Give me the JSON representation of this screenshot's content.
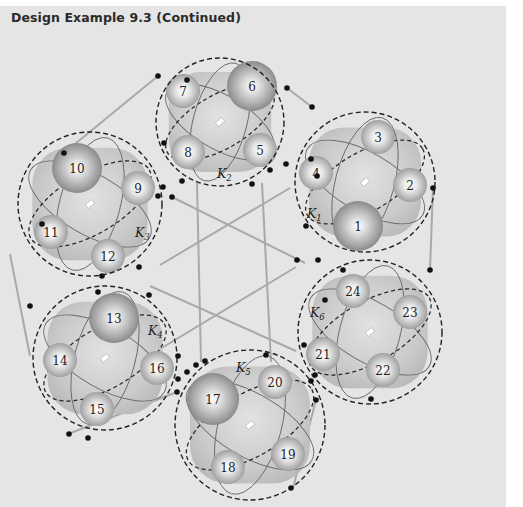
{
  "header": {
    "title": "Design Example 9.3  (Continued)"
  },
  "diagram": {
    "colors": {
      "panel_bg": "#e5e5e5",
      "line": "#a9a9a9",
      "dashed": "#222222",
      "node": "#111111",
      "cluster_fill": "#c8c8c8",
      "sphere_light": "#ffffff",
      "sphere_dark": "#8a8a8a"
    },
    "clusters": [
      {
        "id": "K1",
        "label": "K",
        "sub": "1",
        "cx": 365,
        "cy": 182,
        "r": 70,
        "label_x": 307,
        "label_y": 218,
        "spheres": [
          {
            "n": "1",
            "x": 358,
            "y": 226,
            "r": 25
          },
          {
            "n": "2",
            "x": 410,
            "y": 185,
            "r": 17
          },
          {
            "n": "3",
            "x": 378,
            "y": 137,
            "r": 17
          },
          {
            "n": "4",
            "x": 316,
            "y": 173,
            "r": 17
          }
        ]
      },
      {
        "id": "K2",
        "label": "K",
        "sub": "2",
        "cx": 220,
        "cy": 122,
        "r": 64,
        "label_x": 217,
        "label_y": 178,
        "spheres": [
          {
            "n": "5",
            "x": 260,
            "y": 150,
            "r": 17
          },
          {
            "n": "6",
            "x": 252,
            "y": 86,
            "r": 25
          },
          {
            "n": "7",
            "x": 183,
            "y": 91,
            "r": 17
          },
          {
            "n": "8",
            "x": 188,
            "y": 152,
            "r": 17
          }
        ]
      },
      {
        "id": "K3",
        "label": "K",
        "sub": "3",
        "cx": 90,
        "cy": 204,
        "r": 72,
        "label_x": 135,
        "label_y": 237,
        "spheres": [
          {
            "n": "9",
            "x": 138,
            "y": 188,
            "r": 17
          },
          {
            "n": "10",
            "x": 77,
            "y": 168,
            "r": 25
          },
          {
            "n": "11",
            "x": 51,
            "y": 232,
            "r": 17
          },
          {
            "n": "12",
            "x": 108,
            "y": 256,
            "r": 17
          }
        ]
      },
      {
        "id": "K4",
        "label": "K",
        "sub": "4",
        "cx": 105,
        "cy": 358,
        "r": 72,
        "label_x": 148,
        "label_y": 335,
        "spheres": [
          {
            "n": "13",
            "x": 114,
            "y": 318,
            "r": 25
          },
          {
            "n": "14",
            "x": 60,
            "y": 360,
            "r": 17
          },
          {
            "n": "15",
            "x": 97,
            "y": 409,
            "r": 17
          },
          {
            "n": "16",
            "x": 157,
            "y": 368,
            "r": 17
          }
        ]
      },
      {
        "id": "K5",
        "label": "K",
        "sub": "5",
        "cx": 250,
        "cy": 425,
        "r": 75,
        "label_x": 236,
        "label_y": 372,
        "spheres": [
          {
            "n": "17",
            "x": 213,
            "y": 399,
            "r": 26
          },
          {
            "n": "18",
            "x": 228,
            "y": 467,
            "r": 17
          },
          {
            "n": "19",
            "x": 288,
            "y": 454,
            "r": 17
          },
          {
            "n": "20",
            "x": 275,
            "y": 382,
            "r": 17
          }
        ]
      },
      {
        "id": "K6",
        "label": "K",
        "sub": "6",
        "cx": 370,
        "cy": 332,
        "r": 72,
        "label_x": 310,
        "label_y": 317,
        "spheres": [
          {
            "n": "21",
            "x": 323,
            "y": 354,
            "r": 17
          },
          {
            "n": "22",
            "x": 383,
            "y": 370,
            "r": 17
          },
          {
            "n": "23",
            "x": 410,
            "y": 312,
            "r": 17
          },
          {
            "n": "24",
            "x": 353,
            "y": 291,
            "r": 17
          }
        ]
      }
    ],
    "links": [
      [
        158,
        76,
        64,
        153
      ],
      [
        287,
        88,
        312,
        107
      ],
      [
        433,
        188,
        430,
        270
      ],
      [
        430,
        270,
        430,
        270
      ],
      [
        316,
        400,
        293,
        488
      ],
      [
        177,
        392,
        68,
        434
      ],
      [
        10,
        254,
        30,
        356
      ],
      [
        172,
        197,
        305,
        263
      ],
      [
        197,
        183,
        201,
        362
      ],
      [
        262,
        183,
        271,
        362
      ],
      [
        290,
        188,
        160,
        265
      ],
      [
        155,
        352,
        296,
        267
      ],
      [
        150,
        286,
        296,
        351
      ]
    ],
    "nodes": [
      [
        158,
        76
      ],
      [
        187,
        80
      ],
      [
        287,
        88
      ],
      [
        312,
        107
      ],
      [
        311,
        159
      ],
      [
        317,
        176
      ],
      [
        306,
        226
      ],
      [
        318,
        260
      ],
      [
        297,
        260
      ],
      [
        433,
        188
      ],
      [
        64,
        153
      ],
      [
        158,
        196
      ],
      [
        163,
        187
      ],
      [
        42,
        224
      ],
      [
        102,
        276
      ],
      [
        139,
        267
      ],
      [
        172,
        197
      ],
      [
        164,
        143
      ],
      [
        182,
        181
      ],
      [
        270,
        170
      ],
      [
        286,
        164
      ],
      [
        252,
        184
      ],
      [
        30,
        306
      ],
      [
        98,
        292
      ],
      [
        149,
        295
      ],
      [
        178,
        379
      ],
      [
        178,
        356
      ],
      [
        88,
        438
      ],
      [
        69,
        434
      ],
      [
        196,
        365
      ],
      [
        205,
        361
      ],
      [
        266,
        355
      ],
      [
        311,
        381
      ],
      [
        316,
        400
      ],
      [
        291,
        488
      ],
      [
        177,
        392
      ],
      [
        187,
        372
      ],
      [
        325,
        300
      ],
      [
        343,
        270
      ],
      [
        430,
        270
      ],
      [
        304,
        345
      ],
      [
        315,
        375
      ],
      [
        371,
        399
      ]
    ]
  }
}
